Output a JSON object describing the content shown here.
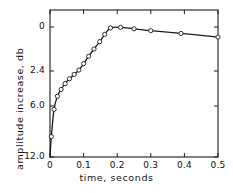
{
  "chart_data": {
    "type": "line",
    "title": "",
    "subtitle": "",
    "xlabel": "time,  seconds",
    "ylabel": "amplitude  increase,  db",
    "xlim": [
      0,
      0.5
    ],
    "ylim": [
      12.0,
      0
    ],
    "grid": false,
    "legend": null,
    "y_axis_note": "non-linear (decibel) spacing; labels descend from 0 at top to 12.0 at bottom",
    "xticks": [
      {
        "value": 0,
        "label": "0"
      },
      {
        "value": 0.1,
        "label": "0.1"
      },
      {
        "value": 0.2,
        "label": "0.2"
      },
      {
        "value": 0.3,
        "label": "0.3"
      },
      {
        "value": 0.4,
        "label": "0.4"
      },
      {
        "value": 0.5,
        "label": "0.5"
      }
    ],
    "yticks": [
      {
        "value": 0,
        "label": "0",
        "pixel_y": 27
      },
      {
        "value": 2.4,
        "label": "2.4",
        "pixel_y": 71
      },
      {
        "value": 6.0,
        "label": "6.0",
        "pixel_y": 106
      },
      {
        "value": 12.0,
        "label": "12.0",
        "pixel_y": 157
      }
    ],
    "series": [
      {
        "name": "amplitude increase",
        "marker": "open-circle",
        "line": "solid",
        "x": [
          0.0,
          0.004,
          0.012,
          0.022,
          0.033,
          0.045,
          0.058,
          0.072,
          0.086,
          0.1,
          0.115,
          0.131,
          0.148,
          0.163,
          0.18,
          0.21,
          0.25,
          0.3,
          0.39,
          0.5
        ],
        "y": [
          12.0,
          9.6,
          6.4,
          5.0,
          4.3,
          3.7,
          3.2,
          2.75,
          2.35,
          2.0,
          1.6,
          1.2,
          0.8,
          0.4,
          0.05,
          0.02,
          0.1,
          0.2,
          0.35,
          0.55
        ]
      }
    ]
  },
  "axes": {
    "frame_left": 50,
    "frame_right": 218,
    "frame_top": 10,
    "frame_bottom": 157
  }
}
